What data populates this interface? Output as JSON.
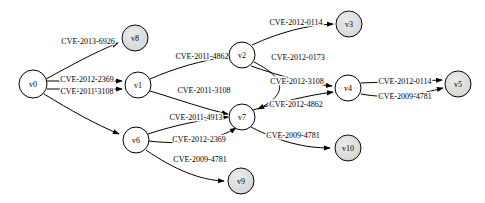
{
  "graph": {
    "title": "Attack graph with CVE-labelled edges",
    "type": "directed-graph",
    "background": "#ffffff",
    "node_fill_terminal": "#d4d4d4",
    "node_fill_intermediate": "#ffffff",
    "node_stroke": "#000000",
    "edge_color": "#000000",
    "nodes": [
      {
        "id": "v0",
        "label": "v0",
        "x": 33,
        "y": 84,
        "r": 14,
        "fill": "white"
      },
      {
        "id": "v8",
        "label": "v8",
        "x": 135,
        "y": 38,
        "r": 13,
        "fill": "gray"
      },
      {
        "id": "v1",
        "label": "v1",
        "x": 138,
        "y": 85,
        "r": 13,
        "fill": "white"
      },
      {
        "id": "v6",
        "label": "v6",
        "x": 136,
        "y": 140,
        "r": 13,
        "fill": "white"
      },
      {
        "id": "v2",
        "label": "v2",
        "x": 242,
        "y": 55,
        "r": 13,
        "fill": "white"
      },
      {
        "id": "v7",
        "label": "v7",
        "x": 242,
        "y": 117,
        "r": 13,
        "fill": "white"
      },
      {
        "id": "v9",
        "label": "v9",
        "x": 241,
        "y": 181,
        "r": 13,
        "fill": "gray"
      },
      {
        "id": "v3",
        "label": "v3",
        "x": 349,
        "y": 24,
        "r": 13,
        "fill": "gray"
      },
      {
        "id": "v4",
        "label": "v4",
        "x": 348,
        "y": 88,
        "r": 13,
        "fill": "white"
      },
      {
        "id": "v10",
        "label": "v10",
        "x": 348,
        "y": 148,
        "r": 13,
        "fill": "gray"
      },
      {
        "id": "v5",
        "label": "v5",
        "x": 458,
        "y": 84,
        "r": 13,
        "fill": "gray"
      }
    ],
    "edges": [
      {
        "id": "e0",
        "from": "v0",
        "to": "v8",
        "label": "CVE-2013-6926",
        "label_x": 88,
        "label_y": 41,
        "path": "M 46 79 C 70 66 95 52 118 43"
      },
      {
        "id": "e1",
        "from": "v0",
        "to": "v1",
        "label": "CVE-2012-2369",
        "label_x": 87,
        "label_y": 79,
        "path": "M 47 81 L 122 81"
      },
      {
        "id": "e2",
        "from": "v0",
        "to": "v1",
        "label": "CVE-2011-3108",
        "label_x": 87,
        "label_y": 91,
        "path": "M 47 89 L 122 89"
      },
      {
        "id": "e3",
        "from": "v0",
        "to": "v6",
        "label": "",
        "label_x": 0,
        "label_y": 0,
        "path": "M 44 94 C 70 110 95 124 119 134"
      },
      {
        "id": "e4",
        "from": "v1",
        "to": "v2",
        "label": "CVE-2011-4862",
        "label_x": 202,
        "label_y": 56,
        "path": "M 150 79 C 175 68 203 60 227 57"
      },
      {
        "id": "e5",
        "from": "v1",
        "to": "v7",
        "label": "CVE-2011-3108",
        "label_x": 204,
        "label_y": 90,
        "path": "M 150 91 C 180 100 205 109 228 114"
      },
      {
        "id": "e6",
        "from": "v2",
        "to": "v3",
        "label": "CVE-2012-0114",
        "label_x": 296,
        "label_y": 22,
        "path": "M 252 45 C 280 32 308 25 333 24"
      },
      {
        "id": "e7",
        "from": "v2",
        "to": "v7",
        "label": "CVE-2012-0173",
        "label_x": 298,
        "label_y": 57,
        "path": "M 254 62 C 290 80 285 96 258 109"
      },
      {
        "id": "e8",
        "from": "v2",
        "to": "v4",
        "label": "CVE-2012-3108",
        "label_x": 297,
        "label_y": 81,
        "path": "M 251 66 C 280 76 308 84 332 86"
      },
      {
        "id": "e9",
        "from": "v6",
        "to": "v7",
        "label": "CVE-2011-4913",
        "label_x": 196,
        "label_y": 117,
        "path": "M 148 134 C 175 125 205 119 228 117"
      },
      {
        "id": "e10",
        "from": "v6",
        "to": "v7",
        "label": "CVE-2012-2369",
        "label_x": 199,
        "label_y": 139,
        "path": "M 149 141 C 190 146 220 138 236 128"
      },
      {
        "id": "e11",
        "from": "v6",
        "to": "v9",
        "label": "CVE-2009-4781",
        "label_x": 200,
        "label_y": 159,
        "path": "M 146 150 C 175 170 200 180 224 181"
      },
      {
        "id": "e12",
        "from": "v7",
        "to": "v4",
        "label": "CVE-2012-4862",
        "label_x": 296,
        "label_y": 104,
        "path": "M 253 110 C 280 102 310 95 333 92"
      },
      {
        "id": "e13",
        "from": "v7",
        "to": "v10",
        "label": "CVE-2009-4781",
        "label_x": 293,
        "label_y": 135,
        "path": "M 251 127 C 280 142 305 148 330 148"
      },
      {
        "id": "e14",
        "from": "v4",
        "to": "v5",
        "label": "CVE-2012-0114",
        "label_x": 405,
        "label_y": 81,
        "path": "M 361 83 L 442 80"
      },
      {
        "id": "e15",
        "from": "v4",
        "to": "v5",
        "label": "CVE-2009-4781",
        "label_x": 405,
        "label_y": 96,
        "path": "M 361 94 C 395 100 420 94 443 88"
      }
    ]
  }
}
